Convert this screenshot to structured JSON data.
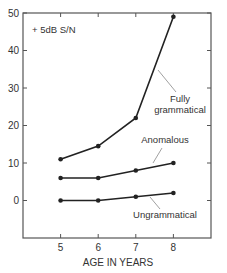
{
  "chart_data": {
    "type": "line",
    "title": "",
    "annotation": "+ 5dB S/N",
    "xlabel": "AGE IN YEARS",
    "ylabel": "",
    "x": [
      5,
      6,
      7,
      8
    ],
    "x_ticks": [
      "5",
      "6",
      "7",
      "8"
    ],
    "y_ticks": [
      "0",
      "10",
      "20",
      "30",
      "40",
      "50"
    ],
    "xlim": [
      4,
      9
    ],
    "ylim": [
      -10,
      50
    ],
    "grid": false,
    "legend_position": "inline labels",
    "series": [
      {
        "name": "Fully grammatical",
        "label_lines": [
          "Fully",
          "grammatical"
        ],
        "values": [
          11,
          14.5,
          22,
          49
        ]
      },
      {
        "name": "Anomalous",
        "label_lines": [
          "Anomalous"
        ],
        "values": [
          6,
          6,
          8,
          10
        ]
      },
      {
        "name": "Ungrammatical",
        "label_lines": [
          "Ungrammatical"
        ],
        "values": [
          0,
          0,
          1,
          2
        ]
      }
    ]
  },
  "colors": {
    "line": "#222222",
    "axis": "#555555",
    "text": "#333333",
    "leader": "#888888"
  }
}
